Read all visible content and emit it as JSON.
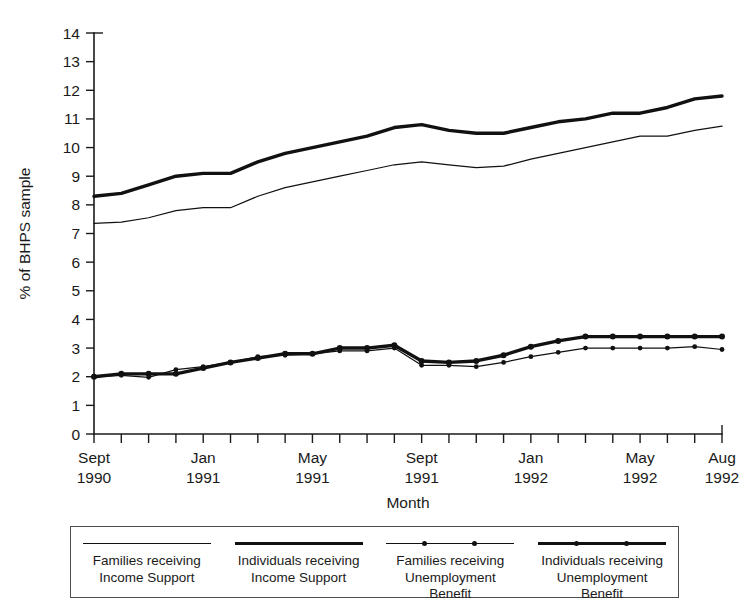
{
  "figure": {
    "clipped_top_caption": ""
  },
  "axes": {
    "y_title": "% of BHPS sample",
    "x_title": "Month",
    "y_ticks": [
      "0",
      "1",
      "2",
      "3",
      "4",
      "5",
      "6",
      "7",
      "8",
      "9",
      "10",
      "11",
      "12",
      "13",
      "14"
    ],
    "x_tick_labels": [
      {
        "index": 0,
        "line1": "Sept",
        "line2": "1990"
      },
      {
        "index": 4,
        "line1": "Jan",
        "line2": "1991"
      },
      {
        "index": 8,
        "line1": "May",
        "line2": "1991"
      },
      {
        "index": 12,
        "line1": "Sept",
        "line2": "1991"
      },
      {
        "index": 16,
        "line1": "Jan",
        "line2": "1992"
      },
      {
        "index": 20,
        "line1": "May",
        "line2": "1992"
      },
      {
        "index": 23,
        "line1": "Aug",
        "line2": "1992"
      }
    ]
  },
  "legend": {
    "items": [
      {
        "label_line1": "Families receiving",
        "label_line2": "Income Support",
        "label_line3": "",
        "style": "thin",
        "markers": false
      },
      {
        "label_line1": "Individuals receiving",
        "label_line2": "Income Support",
        "label_line3": "",
        "style": "thick",
        "markers": false
      },
      {
        "label_line1": "Families receiving",
        "label_line2": "Unemployment",
        "label_line3": "Benefit",
        "style": "thin",
        "markers": true
      },
      {
        "label_line1": "Individuals receiving",
        "label_line2": "Unemployment",
        "label_line3": "Benefit",
        "style": "thick",
        "markers": true
      }
    ]
  },
  "chart_data": {
    "type": "line",
    "title": "",
    "xlabel": "Month",
    "ylabel": "% of BHPS sample",
    "ylim": [
      0,
      14
    ],
    "ytick_step": 1,
    "grid": false,
    "legend_position": "bottom",
    "x": [
      "Sept 1990",
      "Oct 1990",
      "Nov 1990",
      "Dec 1990",
      "Jan 1991",
      "Feb 1991",
      "Mar 1991",
      "Apr 1991",
      "May 1991",
      "Jun 1991",
      "Jul 1991",
      "Aug 1991",
      "Sept 1991",
      "Oct 1991",
      "Nov 1991",
      "Dec 1991",
      "Jan 1992",
      "Feb 1992",
      "Mar 1992",
      "Apr 1992",
      "May 1992",
      "Jun 1992",
      "Jul 1992",
      "Aug 1992"
    ],
    "series": [
      {
        "name": "Individuals receiving Income Support",
        "style": "thick",
        "markers": false,
        "values": [
          8.3,
          8.4,
          8.7,
          9.0,
          9.1,
          9.1,
          9.5,
          9.8,
          10.0,
          10.2,
          10.4,
          10.7,
          10.8,
          10.6,
          10.5,
          10.5,
          10.7,
          10.9,
          11.0,
          11.2,
          11.2,
          11.4,
          11.7,
          11.8
        ]
      },
      {
        "name": "Families receiving Income Support",
        "style": "thin",
        "markers": false,
        "values": [
          7.35,
          7.4,
          7.55,
          7.8,
          7.9,
          7.9,
          8.3,
          8.6,
          8.8,
          9.0,
          9.2,
          9.4,
          9.5,
          9.4,
          9.3,
          9.35,
          9.6,
          9.8,
          10.0,
          10.2,
          10.4,
          10.4,
          10.6,
          10.75
        ]
      },
      {
        "name": "Individuals receiving Unemployment Benefit",
        "style": "thick",
        "markers": true,
        "values": [
          2.0,
          2.1,
          2.1,
          2.1,
          2.3,
          2.5,
          2.65,
          2.8,
          2.8,
          3.0,
          3.0,
          3.1,
          2.55,
          2.5,
          2.55,
          2.75,
          3.05,
          3.25,
          3.4,
          3.4,
          3.4,
          3.4,
          3.4,
          3.4
        ]
      },
      {
        "name": "Families receiving Unemployment Benefit",
        "style": "thin",
        "markers": true,
        "values": [
          2.0,
          2.05,
          1.98,
          2.25,
          2.35,
          2.5,
          2.7,
          2.75,
          2.8,
          2.9,
          2.9,
          3.0,
          2.4,
          2.4,
          2.35,
          2.5,
          2.7,
          2.85,
          3.0,
          3.0,
          3.0,
          3.0,
          3.05,
          2.95
        ]
      }
    ]
  }
}
